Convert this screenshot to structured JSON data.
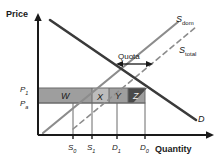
{
  "figure": {
    "type": "economics-supply-demand-quota-diagram",
    "axes": {
      "y_label": "Price",
      "x_label": "Quantity"
    },
    "price_ticks": [
      {
        "id": "P1",
        "base": "P",
        "sub": "1",
        "y": 88
      },
      {
        "id": "Pa",
        "base": "P",
        "sub": "a",
        "y": 103
      }
    ],
    "quantity_ticks": [
      {
        "id": "S0",
        "base": "S",
        "sub": "0",
        "x": 73
      },
      {
        "id": "S1",
        "base": "S",
        "sub": "1",
        "x": 92
      },
      {
        "id": "D1",
        "base": "D",
        "sub": "1",
        "x": 117
      },
      {
        "id": "D0",
        "base": "D",
        "sub": "0",
        "x": 145
      }
    ],
    "curves": [
      {
        "id": "demand",
        "base": "D",
        "sub": "",
        "style": "solid",
        "color": "#3a3a3a",
        "label_x": 199,
        "label_y": 122
      },
      {
        "id": "s_dom",
        "base": "S",
        "sub": "dom",
        "style": "solid",
        "color": "#8c8c8c",
        "label_x": 176,
        "label_y": 22
      },
      {
        "id": "s_total",
        "base": "S",
        "sub": "total",
        "style": "dashed",
        "color": "#8c8c8c",
        "label_x": 181,
        "label_y": 52
      }
    ],
    "annotation": {
      "quota_label": "Quota",
      "arrow_x_start": 118,
      "arrow_x_end": 150,
      "arrow_y": 62
    },
    "regions": [
      {
        "id": "W",
        "label": "W",
        "fill": "#9e9e9e",
        "text_tone": "light"
      },
      {
        "id": "X",
        "label": "X",
        "fill": "#bcbcbc",
        "text_tone": "light"
      },
      {
        "id": "Y",
        "label": "Y",
        "fill": "#9e9e9e",
        "text_tone": "light"
      },
      {
        "id": "Z",
        "label": "Z",
        "fill": "#4a4a4a",
        "text_tone": "dark"
      }
    ],
    "colors": {
      "background": "#ffffff",
      "axis": "#1a1a1a",
      "demand": "#3a3a3a",
      "supply": "#8c8c8c",
      "band_light": "#bcbcbc",
      "band_mid": "#9e9e9e",
      "band_dark": "#4a4a4a"
    }
  }
}
